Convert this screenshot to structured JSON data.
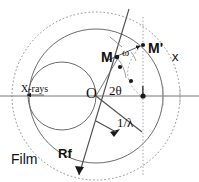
{
  "figure": {
    "type": "ewald-sphere-xray-diffraction-diagram",
    "width": 199,
    "height": 182,
    "background_color": "#ffffff",
    "line_color": "#555555",
    "text_color": "#111111"
  },
  "labels": {
    "origin": "O",
    "point_m": "M",
    "point_m_prime": "M'",
    "point_i": "I",
    "angle_omega": "ω",
    "angle_two_theta": "2θ",
    "reciprocal_lambda": "1/λ",
    "xrays": "X-rays",
    "film": "Film",
    "rf": "Rf",
    "axis_x": "x"
  },
  "geometry": {
    "center": {
      "x": 96,
      "y": 96
    },
    "horizontal_axis_y": 96,
    "circles": [
      {
        "name": "film-circle-dotted",
        "cx": 96,
        "cy": 96,
        "r": 84,
        "style": "dotted"
      },
      {
        "name": "outer-circle-solid",
        "cx": 96,
        "cy": 96,
        "r": 67,
        "style": "solid"
      },
      {
        "name": "ewald-sphere",
        "cx": 62,
        "cy": 96,
        "r": 34,
        "style": "solid"
      }
    ],
    "vertical_dotted_line_x": 143,
    "diagonal_line": {
      "x1": 129,
      "y1": 9,
      "x2": 77,
      "y2": 179
    },
    "lambda_vector": {
      "x1": 96,
      "y1": 96,
      "x2": 144,
      "y2": 133
    },
    "markers": [
      {
        "name": "point-m",
        "x": 117,
        "y": 57
      },
      {
        "name": "point-m-prime",
        "x": 143,
        "y": 45
      },
      {
        "name": "point-i",
        "x": 143,
        "y": 96
      },
      {
        "name": "arc-dot-1",
        "x": 120,
        "y": 66
      },
      {
        "name": "arc-dot-2",
        "x": 131,
        "y": 80
      }
    ]
  }
}
